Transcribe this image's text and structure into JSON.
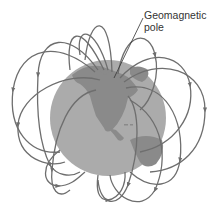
{
  "diagram": {
    "label": {
      "line1": "Geomagnetic",
      "line2": "pole"
    },
    "colors": {
      "background": "#ffffff",
      "ocean": "#ababab",
      "land": "#8a8a8a",
      "field_line": "#6e6e6e",
      "label_text": "#333333"
    },
    "globe": {
      "cx": 108,
      "cy": 118,
      "r": 58
    },
    "pole_point": {
      "x": 114,
      "y": 78
    }
  }
}
